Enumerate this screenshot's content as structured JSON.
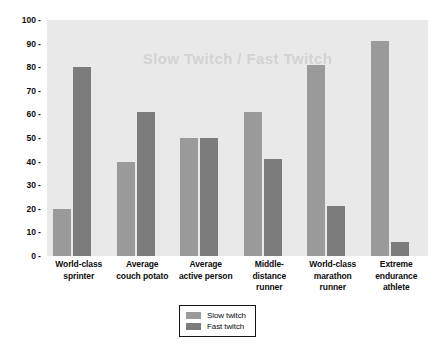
{
  "chart_data": {
    "type": "bar",
    "title": "",
    "xlabel": "",
    "ylabel": "Percent of total muscle",
    "ylim": [
      0,
      100
    ],
    "ytick_step": 10,
    "ytick_labels": [
      "100",
      "90",
      "80",
      "70",
      "60",
      "50",
      "40",
      "30",
      "20",
      "10",
      "0"
    ],
    "grid": false,
    "legend_position": "bottom-center",
    "categories": [
      "World-class sprinter",
      "Average couch potato",
      "Average active person",
      "Middle-distance runner",
      "World-class marathon runner",
      "Extreme endurance athlete"
    ],
    "category_lines": [
      [
        "World-class",
        "sprinter"
      ],
      [
        "Average",
        "couch potato"
      ],
      [
        "Average",
        "active person"
      ],
      [
        "Middle-",
        "distance",
        "runner"
      ],
      [
        "World-class",
        "marathon",
        "runner"
      ],
      [
        "Extreme",
        "endurance",
        "athlete"
      ]
    ],
    "series": [
      {
        "name": "Slow twitch",
        "color": "#9a9a9a",
        "values": [
          20,
          40,
          50,
          61,
          81,
          91
        ]
      },
      {
        "name": "Fast twitch",
        "color": "#7c7c7c",
        "values": [
          80,
          61,
          50,
          41,
          21,
          6
        ]
      }
    ]
  },
  "legend": {
    "items": [
      {
        "label": "Slow twitch",
        "key": "slow"
      },
      {
        "label": "Fast twitch",
        "key": "fast"
      }
    ]
  },
  "colors": {
    "plot_background": "#e9e9e9",
    "page_background": "#ffffff",
    "slow_twitch": "#9a9a9a",
    "fast_twitch": "#7c7c7c",
    "text": "#0d0d0d",
    "legend_border": "#141414"
  },
  "watermark": {
    "text": "Slow Twitch / Fast Twitch"
  }
}
